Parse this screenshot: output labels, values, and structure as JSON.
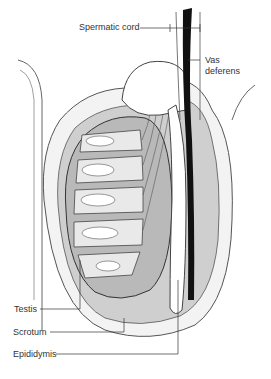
{
  "diagram": {
    "labels": {
      "spermatic_cord": "Spermatic cord",
      "vas_deferens_line1": "Vas",
      "vas_deferens_line2": "deferens",
      "testis": "Testis",
      "scrotum": "Scrotum",
      "epididymis": "Epididymis"
    },
    "colors": {
      "background": "#ffffff",
      "outline": "#444444",
      "scrotum_fill": "#f3f3f3",
      "cavity_fill": "#cfcfcf",
      "testis_fill": "#b9b9b9",
      "lobule_fill": "#e9e9e9",
      "tubule_fill": "#ffffff",
      "vas_fill": "#111111"
    }
  }
}
